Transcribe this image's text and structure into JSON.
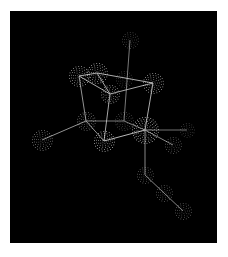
{
  "scene": {
    "type": "molecular-structure-dot-surface",
    "background": "#000000",
    "page_background": "#ffffff",
    "viewport": {
      "x": 10,
      "y": 11,
      "width": 207,
      "height": 232
    },
    "atoms": [
      {
        "id": "top",
        "x": 130,
        "y": 40,
        "r": 8,
        "brightness": 0.35
      },
      {
        "id": "A",
        "x": 79,
        "y": 76,
        "r": 10,
        "brightness": 0.75
      },
      {
        "id": "B",
        "x": 97,
        "y": 73,
        "r": 10,
        "brightness": 0.8
      },
      {
        "id": "D",
        "x": 124,
        "y": 79,
        "r": 8,
        "brightness": 0.3
      },
      {
        "id": "E",
        "x": 153,
        "y": 83,
        "r": 10,
        "brightness": 0.75
      },
      {
        "id": "C",
        "x": 110,
        "y": 94,
        "r": 9,
        "brightness": 0.7
      },
      {
        "id": "F",
        "x": 86,
        "y": 121,
        "r": 9,
        "brightness": 0.55
      },
      {
        "id": "G",
        "x": 124,
        "y": 121,
        "r": 9,
        "brightness": 0.35
      },
      {
        "id": "I",
        "x": 145,
        "y": 130,
        "r": 13,
        "brightness": 0.85
      },
      {
        "id": "H",
        "x": 104,
        "y": 141,
        "r": 10,
        "brightness": 0.85
      },
      {
        "id": "L",
        "x": 42,
        "y": 140,
        "r": 10,
        "brightness": 0.6
      },
      {
        "id": "J",
        "x": 187,
        "y": 130,
        "r": 7,
        "brightness": 0.3
      },
      {
        "id": "K",
        "x": 173,
        "y": 145,
        "r": 8,
        "brightness": 0.45
      },
      {
        "id": "M1",
        "x": 145,
        "y": 175,
        "r": 8,
        "brightness": 0.45
      },
      {
        "id": "M2",
        "x": 164,
        "y": 193,
        "r": 8,
        "brightness": 0.45
      },
      {
        "id": "M3",
        "x": 183,
        "y": 211,
        "r": 8,
        "brightness": 0.45
      }
    ],
    "bonds": [
      [
        "A",
        "B"
      ],
      [
        "A",
        "C"
      ],
      [
        "B",
        "C"
      ],
      [
        "B",
        "E"
      ],
      [
        "C",
        "E"
      ],
      [
        "A",
        "F"
      ],
      [
        "C",
        "H"
      ],
      [
        "top",
        "G"
      ],
      [
        "E",
        "I"
      ],
      [
        "F",
        "G"
      ],
      [
        "F",
        "H"
      ],
      [
        "F",
        "L"
      ],
      [
        "H",
        "I"
      ],
      [
        "G",
        "I"
      ],
      [
        "I",
        "J"
      ],
      [
        "I",
        "K"
      ],
      [
        "I",
        "M1"
      ],
      [
        "M1",
        "M2"
      ],
      [
        "M2",
        "M3"
      ]
    ],
    "bond_color": "#d8d8d8",
    "dot_color": "#ffffff"
  }
}
